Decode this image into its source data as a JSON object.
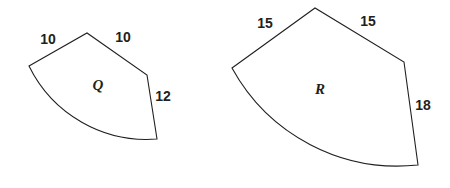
{
  "figure": {
    "stroke_color": "#231f20",
    "fill_color": "#ffffff",
    "background_color": "#ffffff"
  },
  "shapes": [
    {
      "name": "Q",
      "name_label": "Q",
      "labels": {
        "left_side": "10",
        "right_side": "10",
        "far_right_side": "12"
      },
      "outline_path": "M 29 66 L 87 33 L 147 75 L 157 139 A 131 131 0 0 1 29 66 Z",
      "name_pos": {
        "x": 98,
        "y": 87
      },
      "label_pos": {
        "left_side": {
          "x": 48,
          "y": 40
        },
        "right_side": {
          "x": 123,
          "y": 38
        },
        "far_right_side": {
          "x": 163,
          "y": 97
        }
      }
    },
    {
      "name": "R",
      "name_label": "R",
      "labels": {
        "left_side": "15",
        "right_side": "15",
        "far_right_side": "18"
      },
      "outline_path": "M 232 68 L 315 8 L 404 62 L 418 165 A 189 189 0 0 1 232 68 Z",
      "name_pos": {
        "x": 320,
        "y": 91
      },
      "label_pos": {
        "left_side": {
          "x": 265,
          "y": 24
        },
        "right_side": {
          "x": 368,
          "y": 22
        },
        "far_right_side": {
          "x": 423,
          "y": 106
        }
      }
    }
  ]
}
